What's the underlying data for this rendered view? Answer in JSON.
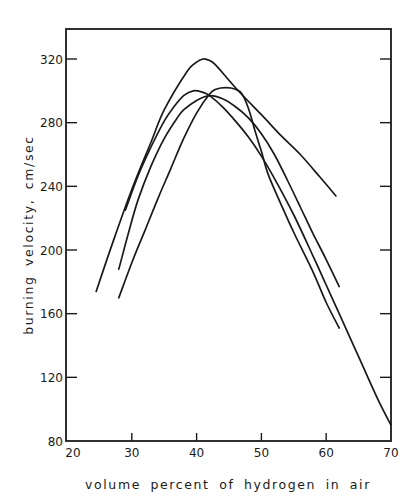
{
  "chart_data": {
    "type": "line",
    "title": "",
    "xlabel": "volume percent of hydrogen in air",
    "ylabel": "burning velocity, cm/sec",
    "xlim": [
      20,
      70
    ],
    "ylim": [
      80,
      340
    ],
    "x_ticks": [
      20,
      30,
      40,
      50,
      60,
      70
    ],
    "y_ticks": [
      80,
      120,
      160,
      200,
      240,
      280,
      320
    ],
    "grid": false,
    "legend": null,
    "series": [
      {
        "name": "curve-1",
        "points": [
          [
            24.5,
            174
          ],
          [
            27,
            204
          ],
          [
            30,
            238
          ],
          [
            33,
            268
          ],
          [
            35,
            288
          ],
          [
            38.5,
            312
          ],
          [
            40,
            318
          ],
          [
            41,
            320
          ],
          [
            42,
            319
          ],
          [
            43,
            316
          ],
          [
            46,
            302
          ],
          [
            50,
            285
          ],
          [
            53,
            272
          ],
          [
            56,
            260
          ],
          [
            59,
            246
          ],
          [
            61.5,
            234
          ]
        ]
      },
      {
        "name": "curve-2",
        "points": [
          [
            29,
            225
          ],
          [
            31,
            247
          ],
          [
            33,
            265
          ],
          [
            35,
            281
          ],
          [
            36.5,
            290
          ],
          [
            38,
            297
          ],
          [
            39.5,
            300
          ],
          [
            41,
            299
          ],
          [
            42,
            297
          ],
          [
            44,
            290
          ],
          [
            46,
            281
          ],
          [
            48,
            271
          ],
          [
            50,
            259
          ],
          [
            52,
            245
          ],
          [
            55,
            222
          ],
          [
            58,
            196
          ],
          [
            60,
            178
          ],
          [
            62,
            160
          ],
          [
            65,
            133
          ],
          [
            68,
            106
          ],
          [
            70,
            90
          ]
        ]
      },
      {
        "name": "curve-3",
        "points": [
          [
            28,
            170
          ],
          [
            30,
            192
          ],
          [
            32,
            212
          ],
          [
            34,
            232
          ],
          [
            36,
            251
          ],
          [
            38,
            270
          ],
          [
            40,
            286
          ],
          [
            42,
            298
          ],
          [
            43,
            301
          ],
          [
            44.5,
            302
          ],
          [
            46,
            301
          ],
          [
            47,
            298
          ],
          [
            48,
            289
          ],
          [
            49,
            275
          ],
          [
            50,
            262
          ],
          [
            51,
            248
          ],
          [
            53,
            229
          ],
          [
            55,
            211
          ],
          [
            58,
            186
          ],
          [
            60,
            167
          ],
          [
            62,
            151
          ]
        ]
      },
      {
        "name": "curve-4",
        "points": [
          [
            28,
            188
          ],
          [
            29.5,
            211
          ],
          [
            31,
            232
          ],
          [
            33,
            253
          ],
          [
            35,
            270
          ],
          [
            37,
            283
          ],
          [
            38,
            288
          ],
          [
            40,
            294
          ],
          [
            42,
            297
          ],
          [
            44,
            295
          ],
          [
            46,
            290
          ],
          [
            48,
            283
          ],
          [
            50,
            273
          ],
          [
            52,
            260
          ],
          [
            54,
            244
          ],
          [
            56,
            227
          ],
          [
            58,
            210
          ],
          [
            60,
            194
          ],
          [
            62,
            177
          ]
        ]
      }
    ]
  },
  "axes": {
    "x_tick_labels": [
      "20",
      "30",
      "40",
      "50",
      "60",
      "70"
    ],
    "y_tick_labels": [
      "80",
      "120",
      "160",
      "200",
      "240",
      "280",
      "320"
    ],
    "x_title": "volume percent of hydrogen in air",
    "y_title": "burning velocity, cm/sec"
  },
  "style": {
    "line_color": "#1a1a1a",
    "background": "#ffffff"
  }
}
